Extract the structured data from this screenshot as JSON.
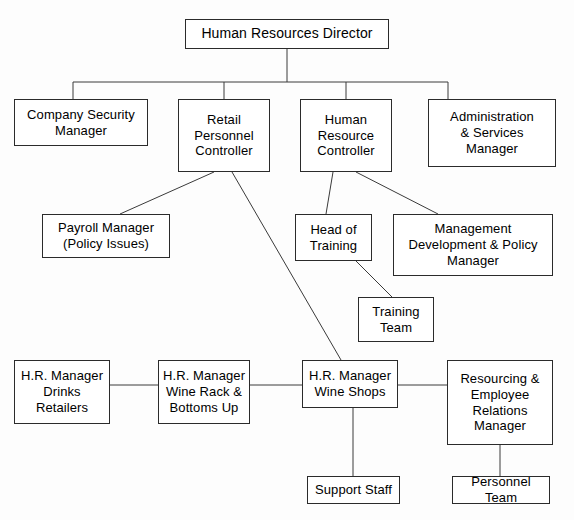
{
  "chart_data": {
    "type": "diagram",
    "nodes": [
      {
        "id": "hr-director",
        "label": "Human Resources Director",
        "x": 185,
        "y": 19,
        "w": 204,
        "h": 30,
        "font_size": 14
      },
      {
        "id": "company-security",
        "label": "Company Security\nManager",
        "x": 14,
        "y": 99,
        "w": 134,
        "h": 47,
        "font_size": 13
      },
      {
        "id": "retail-personnel",
        "label": "Retail\nPersonnel\nController",
        "x": 178,
        "y": 99,
        "w": 92,
        "h": 73,
        "font_size": 13
      },
      {
        "id": "human-resource-ctrl",
        "label": "Human\nResource\nController",
        "x": 300,
        "y": 99,
        "w": 92,
        "h": 73,
        "font_size": 13
      },
      {
        "id": "admin-services",
        "label": "Administration\n& Services\nManager",
        "x": 428,
        "y": 99,
        "w": 128,
        "h": 68,
        "font_size": 13
      },
      {
        "id": "payroll-manager",
        "label": "Payroll Manager\n(Policy Issues)",
        "x": 42,
        "y": 214,
        "w": 128,
        "h": 44,
        "font_size": 13
      },
      {
        "id": "head-of-training",
        "label": "Head of\nTraining",
        "x": 295,
        "y": 214,
        "w": 77,
        "h": 47,
        "font_size": 13
      },
      {
        "id": "mgmt-development",
        "label": "Management\nDevelopment & Policy\nManager",
        "x": 393,
        "y": 214,
        "w": 160,
        "h": 62,
        "font_size": 13
      },
      {
        "id": "training-team",
        "label": "Training\nTeam",
        "x": 358,
        "y": 297,
        "w": 76,
        "h": 45,
        "font_size": 13
      },
      {
        "id": "hrm-drinks",
        "label": "H.R. Manager\nDrinks\nRetailers",
        "x": 14,
        "y": 360,
        "w": 96,
        "h": 64,
        "font_size": 13
      },
      {
        "id": "hrm-wine-rack",
        "label": "H.R. Manager\nWine Rack &\nBottoms Up",
        "x": 158,
        "y": 360,
        "w": 92,
        "h": 64,
        "font_size": 13
      },
      {
        "id": "hrm-wine-shops",
        "label": "H.R. Manager\nWine Shops",
        "x": 302,
        "y": 360,
        "w": 96,
        "h": 48,
        "font_size": 13
      },
      {
        "id": "resourcing-employee",
        "label": "Resourcing &\nEmployee\nRelations\nManager",
        "x": 447,
        "y": 360,
        "w": 106,
        "h": 85,
        "font_size": 13
      },
      {
        "id": "support-staff",
        "label": "Support Staff",
        "x": 307,
        "y": 476,
        "w": 93,
        "h": 28,
        "font_size": 13
      },
      {
        "id": "personnel-team",
        "label": "Personnel Team",
        "x": 452,
        "y": 476,
        "w": 98,
        "h": 28,
        "font_size": 13
      }
    ],
    "edges": [
      {
        "id": "edge-director-bus",
        "from": "hr-director",
        "to": "bus",
        "points": "287,49 287,82"
      },
      {
        "id": "edge-bus-horizontal",
        "from": "bus",
        "to": "bus",
        "points": "73,82 448,82"
      },
      {
        "id": "edge-bus-security",
        "from": "bus",
        "to": "company-security",
        "points": "73,82 73,99"
      },
      {
        "id": "edge-bus-retail",
        "from": "bus",
        "to": "retail-personnel",
        "points": "224,82 224,99"
      },
      {
        "id": "edge-bus-hrc",
        "from": "bus",
        "to": "human-resource-ctrl",
        "points": "346,82 346,99"
      },
      {
        "id": "edge-bus-admin",
        "from": "bus",
        "to": "admin-services",
        "points": "448,82 448,99"
      },
      {
        "id": "edge-retail-payroll",
        "from": "retail-personnel",
        "to": "payroll-manager",
        "points": "214,172 120,214"
      },
      {
        "id": "edge-retail-wineshops",
        "from": "retail-personnel",
        "to": "hrm-wine-shops",
        "points": "232,172 341,360"
      },
      {
        "id": "edge-hrc-training",
        "from": "human-resource-ctrl",
        "to": "head-of-training",
        "points": "333,172 326,214"
      },
      {
        "id": "edge-hrc-mgmtdev",
        "from": "human-resource-ctrl",
        "to": "mgmt-development",
        "points": "356,172 438,214"
      },
      {
        "id": "edge-training-team",
        "from": "head-of-training",
        "to": "training-team",
        "points": "356,261 392,297"
      },
      {
        "id": "edge-drinks-winerack",
        "from": "hrm-drinks",
        "to": "hrm-wine-rack",
        "points": "110,385 158,385"
      },
      {
        "id": "edge-winerack-wineshops",
        "from": "hrm-wine-rack",
        "to": "hrm-wine-shops",
        "points": "250,385 302,385"
      },
      {
        "id": "edge-wineshops-resourcing",
        "from": "hrm-wine-shops",
        "to": "resourcing-employee",
        "points": "398,385 447,385"
      },
      {
        "id": "edge-wineshops-support",
        "from": "hrm-wine-shops",
        "to": "support-staff",
        "points": "353,408 353,476"
      },
      {
        "id": "edge-resourcing-personnel",
        "from": "resourcing-employee",
        "to": "personnel-team",
        "points": "500,445 500,476"
      }
    ],
    "style": {
      "background": "#fdfdfd",
      "box_fill": "#ffffff",
      "box_border": "#2b2b2b",
      "line_color": "#3a3a3a",
      "text_color": "#000000"
    }
  }
}
